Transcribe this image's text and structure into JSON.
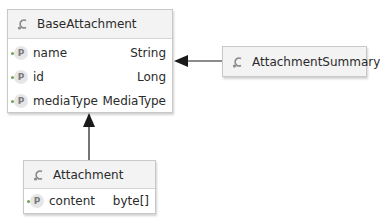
{
  "diagram": {
    "type": "uml-class-diagram",
    "nodes": {
      "base": {
        "name": "BaseAttachment",
        "stereotype_icon": "class-icon",
        "properties": [
          {
            "name": "name",
            "type": "String",
            "icon": "P"
          },
          {
            "name": "id",
            "type": "Long",
            "icon": "P"
          },
          {
            "name": "mediaType",
            "type": "MediaType",
            "icon": "P"
          }
        ]
      },
      "summary": {
        "name": "AttachmentSummary",
        "stereotype_icon": "class-icon",
        "properties": []
      },
      "attachment": {
        "name": "Attachment",
        "stereotype_icon": "class-icon",
        "properties": [
          {
            "name": "content",
            "type": "byte[]",
            "icon": "P"
          }
        ]
      }
    },
    "edges": [
      {
        "from": "AttachmentSummary",
        "to": "BaseAttachment",
        "kind": "association-arrow"
      },
      {
        "from": "Attachment",
        "to": "BaseAttachment",
        "kind": "association-arrow"
      }
    ],
    "colors": {
      "header_bg": "#f3f3f3",
      "border": "#c8c8c8",
      "arrow": "#1a1a1a",
      "prop_dot": "#6aa84f"
    }
  }
}
